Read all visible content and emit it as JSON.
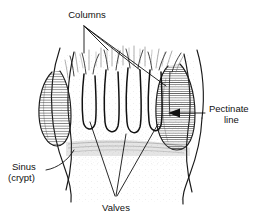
{
  "figure": {
    "kind": "anatomical-line-drawing",
    "background_color": "#ffffff",
    "ink_color": "#111111"
  },
  "labels": {
    "columns": {
      "text": "Columns",
      "position": "top-center",
      "leader_count": 4
    },
    "pectinate": {
      "line1": "Pectinate",
      "line2": "line",
      "position": "right",
      "has_arrow": true,
      "arrow_direction": "left"
    },
    "sinus": {
      "line1": "Sinus",
      "line2": "(crypt)",
      "position": "left",
      "has_arrow": false,
      "leader_count": 1
    },
    "valves": {
      "text": "Valves",
      "position": "bottom-center",
      "leader_count": 3
    }
  },
  "structures": {
    "left_cushion": {
      "name": "left hemorrhoidal cushion",
      "fill_pattern": "horizontal-hatch"
    },
    "right_cushion": {
      "name": "right hemorrhoidal cushion",
      "fill_pattern": "horizontal-hatch"
    },
    "columns_of_morgagni": {
      "name": "anal columns",
      "count": 5
    },
    "pectinate_band": {
      "name": "pectinate line band",
      "fill_pattern": "fine-horizontal-hatch"
    }
  }
}
